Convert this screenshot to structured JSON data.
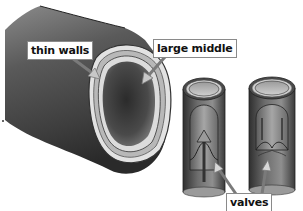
{
  "diagram": {
    "labels": {
      "thin_walls": "thin walls",
      "large_middle": "large middle",
      "valves": "valves"
    },
    "colors": {
      "vessel_dark": "#3a3a3a",
      "vessel_mid": "#777777",
      "vessel_light": "#bdbdbd",
      "wall_layer": "#d9d9d9",
      "label_border": "#8a8a8a",
      "background": "#ffffff"
    }
  }
}
